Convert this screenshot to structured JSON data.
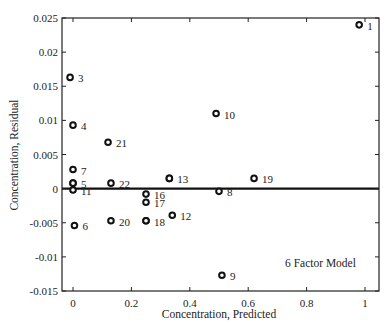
{
  "chart_data": {
    "type": "scatter",
    "title": "",
    "xlabel": "Concentration, Predicted",
    "ylabel": "Concentration, Residual",
    "xlim": [
      -0.03,
      1.02
    ],
    "ylim": [
      -0.015,
      0.025
    ],
    "xticks": [
      "0",
      "0.2",
      "0.4",
      "0.6",
      "0.8",
      "1"
    ],
    "yticks": [
      "0.025",
      "0.02",
      "0.015",
      "0.01",
      "0.005",
      "0",
      "-0.005",
      "-0.01",
      "-0.015"
    ],
    "grid": false,
    "reference_line": {
      "y": 0
    },
    "annotation": "6 Factor Model",
    "points": [
      {
        "label": "1",
        "x": 0.98,
        "y": 0.024
      },
      {
        "label": "2",
        "x": 0.0,
        "y": 0.0008
      },
      {
        "label": "3",
        "x": -0.01,
        "y": 0.0163
      },
      {
        "label": "4",
        "x": 0.0,
        "y": 0.0093
      },
      {
        "label": "5",
        "x": 0.0,
        "y": 0.0008
      },
      {
        "label": "6",
        "x": 0.005,
        "y": -0.0054
      },
      {
        "label": "7",
        "x": 0.0,
        "y": 0.0028
      },
      {
        "label": "8",
        "x": 0.5,
        "y": -0.0004
      },
      {
        "label": "9",
        "x": 0.51,
        "y": -0.0127
      },
      {
        "label": "10",
        "x": 0.49,
        "y": 0.011
      },
      {
        "label": "11",
        "x": 0.0,
        "y": -0.0002
      },
      {
        "label": "12",
        "x": 0.34,
        "y": -0.0039
      },
      {
        "label": "13",
        "x": 0.33,
        "y": 0.0015
      },
      {
        "label": "14",
        "x": 0.33,
        "y": 0.0015
      },
      {
        "label": "15",
        "x": 0.25,
        "y": -0.0047
      },
      {
        "label": "16",
        "x": 0.25,
        "y": -0.0008
      },
      {
        "label": "17",
        "x": 0.25,
        "y": -0.002
      },
      {
        "label": "18",
        "x": 0.25,
        "y": -0.0047
      },
      {
        "label": "19",
        "x": 0.62,
        "y": 0.0015
      },
      {
        "label": "20",
        "x": 0.13,
        "y": -0.0047
      },
      {
        "label": "21",
        "x": 0.12,
        "y": 0.0068
      },
      {
        "label": "22",
        "x": 0.13,
        "y": 0.0008
      }
    ],
    "display_labels": [
      {
        "text": "1",
        "x": 0.98,
        "y": 0.024
      },
      {
        "text": "3",
        "x": -0.01,
        "y": 0.0163
      },
      {
        "text": "4",
        "x": 0.0,
        "y": 0.0093
      },
      {
        "text": "21",
        "x": 0.12,
        "y": 0.0068
      },
      {
        "text": "10",
        "x": 0.49,
        "y": 0.011
      },
      {
        "text": "7",
        "x": 0.0,
        "y": 0.0028
      },
      {
        "text": "5",
        "x": 0.0,
        "y": 0.0008
      },
      {
        "text": "11",
        "x": 0.0,
        "y": -0.0002
      },
      {
        "text": "22",
        "x": 0.13,
        "y": 0.0008
      },
      {
        "text": "6",
        "x": 0.005,
        "y": -0.0054
      },
      {
        "text": "20",
        "x": 0.13,
        "y": -0.0047
      },
      {
        "text": "16",
        "x": 0.25,
        "y": -0.0008
      },
      {
        "text": "17",
        "x": 0.25,
        "y": -0.002
      },
      {
        "text": "18",
        "x": 0.25,
        "y": -0.0047
      },
      {
        "text": "13",
        "x": 0.33,
        "y": 0.0015
      },
      {
        "text": "12",
        "x": 0.34,
        "y": -0.0039
      },
      {
        "text": "8",
        "x": 0.5,
        "y": -0.0004
      },
      {
        "text": "19",
        "x": 0.62,
        "y": 0.0015
      },
      {
        "text": "9",
        "x": 0.51,
        "y": -0.0127
      }
    ]
  }
}
